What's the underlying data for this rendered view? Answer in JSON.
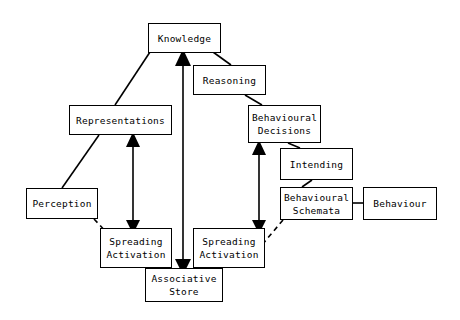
{
  "diagram": {
    "background_color": "#ffffff",
    "line_color": "#000000",
    "nodes": [
      {
        "id": "knowledge",
        "label": "Knowledge",
        "x": 148,
        "y": 23,
        "w": 73,
        "h": 30
      },
      {
        "id": "reasoning",
        "label": "Reasoning",
        "x": 193,
        "y": 65,
        "w": 73,
        "h": 30
      },
      {
        "id": "representations",
        "label": "Representations",
        "x": 69,
        "y": 105,
        "w": 103,
        "h": 30
      },
      {
        "id": "behavioural-decisions",
        "label": "Behavioural\nDecisions",
        "x": 248,
        "y": 105,
        "w": 73,
        "h": 38
      },
      {
        "id": "intending",
        "label": "Intending",
        "x": 280,
        "y": 148,
        "w": 73,
        "h": 32
      },
      {
        "id": "perception",
        "label": "Perception",
        "x": 26,
        "y": 188,
        "w": 72,
        "h": 31
      },
      {
        "id": "behavioural-schemata",
        "label": "Behavioural\nSchemata",
        "x": 280,
        "y": 187,
        "w": 73,
        "h": 33
      },
      {
        "id": "behaviour",
        "label": "Behaviour",
        "x": 363,
        "y": 187,
        "w": 74,
        "h": 33
      },
      {
        "id": "spreading-activation-left",
        "label": "Spreading\nActivation",
        "x": 100,
        "y": 228,
        "w": 72,
        "h": 40
      },
      {
        "id": "spreading-activation-right",
        "label": "Spreading\nActivation",
        "x": 193,
        "y": 228,
        "w": 72,
        "h": 40
      },
      {
        "id": "associative-store",
        "label": "Associative\nStore",
        "x": 145,
        "y": 268,
        "w": 78,
        "h": 34
      }
    ],
    "edges": [
      {
        "id": "representations-knowledge",
        "from": "representations",
        "to": "knowledge",
        "style": "solid",
        "arrows": "none"
      },
      {
        "id": "knowledge-reasoning",
        "from": "knowledge",
        "to": "reasoning",
        "style": "solid",
        "arrows": "none"
      },
      {
        "id": "reasoning-behavioural-decisions",
        "from": "reasoning",
        "to": "behavioural-decisions",
        "style": "solid",
        "arrows": "none"
      },
      {
        "id": "behavioural-decisions-intending",
        "from": "behavioural-decisions",
        "to": "intending",
        "style": "solid",
        "arrows": "none"
      },
      {
        "id": "intending-behavioural-schemata",
        "from": "intending",
        "to": "behavioural-schemata",
        "style": "solid",
        "arrows": "none"
      },
      {
        "id": "behavioural-schemata-behaviour",
        "from": "behavioural-schemata",
        "to": "behaviour",
        "style": "solid",
        "arrows": "none"
      },
      {
        "id": "representations-perception",
        "from": "representations",
        "to": "perception",
        "style": "solid",
        "arrows": "none"
      },
      {
        "id": "representations-spreading-left",
        "from": "representations",
        "to": "spreading-activation-left",
        "style": "solid",
        "arrows": "both"
      },
      {
        "id": "behavioural-decisions-spreading-right",
        "from": "behavioural-decisions",
        "to": "spreading-activation-right",
        "style": "solid",
        "arrows": "both"
      },
      {
        "id": "knowledge-associative-store",
        "from": "knowledge",
        "to": "associative-store",
        "style": "solid",
        "arrows": "both"
      },
      {
        "id": "perception-spreading-left",
        "from": "perception",
        "to": "spreading-activation-left",
        "style": "dashed",
        "arrows": "none"
      },
      {
        "id": "spreading-left-associative-store",
        "from": "spreading-activation-left",
        "to": "associative-store",
        "style": "dashed",
        "arrows": "none"
      },
      {
        "id": "spreading-right-associative-store",
        "from": "spreading-activation-right",
        "to": "associative-store",
        "style": "dashed",
        "arrows": "none"
      },
      {
        "id": "behavioural-schemata-spreading-right",
        "from": "behavioural-schemata",
        "to": "spreading-activation-right",
        "style": "dashed",
        "arrows": "none"
      }
    ]
  }
}
